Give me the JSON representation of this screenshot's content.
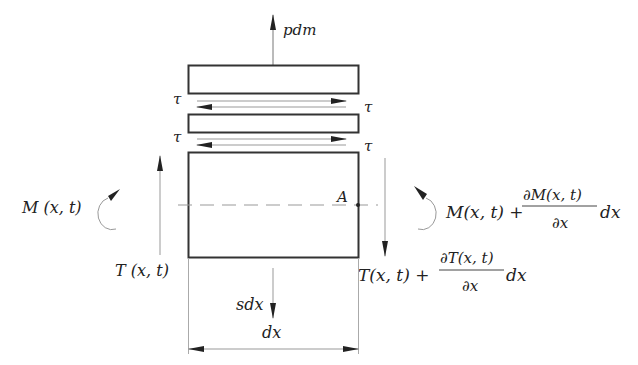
{
  "diagram": {
    "type": "free-body element diagram (beam segment with layered shear)",
    "colors": {
      "stroke": "#333333",
      "thin": "#888888",
      "text": "#222222",
      "background": "#ffffff"
    },
    "labels": {
      "top_load": "pdm",
      "tau_top_left": "τ",
      "tau_top_right": "τ",
      "tau_mid_left": "τ",
      "tau_mid_right": "τ",
      "left_moment": "M (x, t)",
      "left_shear": "T (x, t)",
      "right_moment_base": "M(x, t) +",
      "right_moment_num": "∂M(x, t)",
      "right_moment_den": "∂x",
      "right_moment_tail": "dx",
      "right_shear_base": "T(x, t) +",
      "right_shear_num": "∂T(x, t)",
      "right_shear_den": "∂x",
      "right_shear_tail": "dx",
      "point_a": "A",
      "distributed_load": "sdx",
      "dimension": "dx"
    },
    "elements": {
      "layers": [
        "top layer",
        "middle layer",
        "bottom (main) block"
      ],
      "shear_pairs": 2
    }
  }
}
